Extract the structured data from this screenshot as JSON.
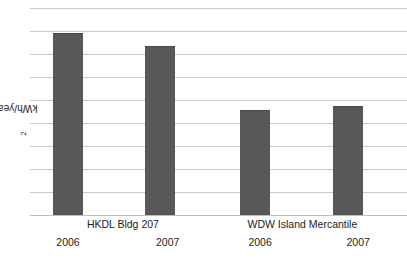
{
  "chart_data": {
    "type": "bar",
    "title": "",
    "xlabel": "",
    "ylabel": "kWh/year-m",
    "ylabel_sub": "2",
    "ylabel_full": "kWh/year-m2",
    "grid": true,
    "legend": false,
    "ylim": [
      0,
      9.35
    ],
    "y_tick_count": 10,
    "y_tick_labels": [],
    "axis_color": "#c9c9c9",
    "bar_color": "#58585a",
    "groups": [
      {
        "name": "HKDL Bldg 207"
      },
      {
        "name": "WDW Island Mercantile"
      }
    ],
    "categories": [
      "2006",
      "2007",
      "2006",
      "2007"
    ],
    "series": [
      {
        "name": "Energy use intensity",
        "values": [
          7.9,
          7.35,
          4.57,
          4.74
        ]
      }
    ],
    "bars": [
      {
        "group": "HKDL Bldg 207",
        "year": "2006",
        "value": 7.9,
        "left_pct": 6.1,
        "width_pct": 8.0,
        "height_pct": 84.7
      },
      {
        "group": "HKDL Bldg 207",
        "year": "2007",
        "value": 7.35,
        "left_pct": 30.5,
        "width_pct": 8.0,
        "height_pct": 78.6
      },
      {
        "group": "WDW Island Mercantile",
        "year": "2006",
        "value": 4.57,
        "left_pct": 55.7,
        "width_pct": 8.0,
        "height_pct": 48.8
      },
      {
        "group": "WDW Island Mercantile",
        "year": "2007",
        "value": 4.74,
        "left_pct": 80.4,
        "width_pct": 8.0,
        "height_pct": 50.7
      }
    ],
    "group_labels": [
      {
        "text": "HKDL Bldg 207",
        "center_pct": 30.2
      },
      {
        "text": "WDW Island Mercantile",
        "center_pct": 74.3
      }
    ],
    "year_labels": [
      {
        "text": "2006",
        "center_pct": 16.7
      },
      {
        "text": "2007",
        "center_pct": 41.2
      },
      {
        "text": "2006",
        "center_pct": 63.9
      },
      {
        "text": "2007",
        "center_pct": 88.0
      }
    ]
  }
}
